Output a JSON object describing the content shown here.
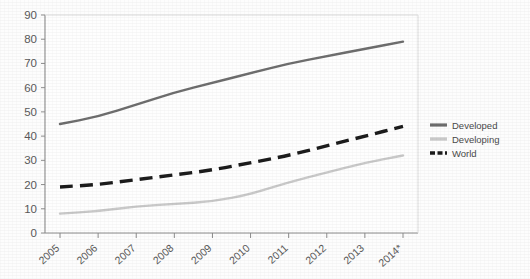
{
  "chart_data": {
    "type": "line",
    "title": "",
    "subtitle": "",
    "xlabel": "",
    "ylabel": "",
    "ylim": [
      0,
      90
    ],
    "ytick_step": 10,
    "ytick_labels": [
      "0",
      "10",
      "20",
      "30",
      "40",
      "50",
      "60",
      "70",
      "80",
      "90"
    ],
    "grid": false,
    "legend_position": "right",
    "categories": [
      "2005",
      "2006",
      "2007",
      "2008",
      "2009",
      "2010",
      "2011",
      "2012",
      "2013",
      "2014*"
    ],
    "series": [
      {
        "name": "Developed",
        "style": "solid",
        "color": "#6e6e6e",
        "values": [
          45,
          48,
          53,
          58,
          62,
          66,
          70,
          73,
          76,
          79
        ]
      },
      {
        "name": "Developing",
        "style": "solid",
        "color": "#c9c9c9",
        "values": [
          8,
          9,
          11,
          12,
          13,
          16,
          21,
          25,
          29,
          32
        ]
      },
      {
        "name": "World",
        "style": "dashed",
        "color": "#1c1c1c",
        "values": [
          19,
          20,
          22,
          24,
          26,
          29,
          32,
          36,
          40,
          44
        ]
      }
    ]
  },
  "legend": {
    "items": [
      {
        "label": "Developed"
      },
      {
        "label": "Developing"
      },
      {
        "label": "World"
      }
    ]
  },
  "colors": {
    "developed": "#6e6e6e",
    "developing": "#c9c9c9",
    "world": "#1c1c1c",
    "axis": "#8c8c8c",
    "tick_text": "#5a5a5a",
    "plot_background": "#fefefe",
    "figure_background": "#fdfdfd"
  }
}
